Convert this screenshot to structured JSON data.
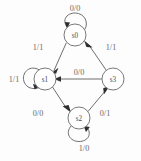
{
  "diagram": {
    "type": "state-transition-diagram",
    "notation": "input/output",
    "background_color": "#fdfdfd",
    "stroke_color": "#5d5d5d",
    "label_color": "#6b6b6b",
    "states": [
      {
        "id": "s0",
        "label": "s0",
        "cx": 75,
        "cy": 35,
        "r": 11
      },
      {
        "id": "s1",
        "label": "s1",
        "cx": 45,
        "cy": 79,
        "r": 11
      },
      {
        "id": "s2",
        "label": "s2",
        "cx": 79,
        "cy": 118,
        "r": 11
      },
      {
        "id": "s3",
        "label": "s3",
        "cx": 113,
        "cy": 79,
        "r": 11
      }
    ],
    "transitions": [
      {
        "from": "s0",
        "to": "s0",
        "label": "0/0",
        "kind": "self-loop",
        "side": "top",
        "label_x": 75,
        "label_y": 8
      },
      {
        "from": "s1",
        "to": "s1",
        "label": "1/1",
        "kind": "self-loop",
        "side": "left",
        "label_x": 14,
        "label_y": 79
      },
      {
        "from": "s2",
        "to": "s2",
        "label": "1/0",
        "kind": "self-loop",
        "side": "bottom",
        "label_x": 84,
        "label_y": 148
      },
      {
        "from": "s0",
        "to": "s1",
        "label": "1/1",
        "kind": "edge",
        "label_x": 38,
        "label_y": 47
      },
      {
        "from": "s3",
        "to": "s0",
        "label": "1/1",
        "kind": "edge",
        "label_x": 111,
        "label_y": 47
      },
      {
        "from": "s3",
        "to": "s1",
        "label": "0/0",
        "kind": "edge",
        "label_x": 79,
        "label_y": 72
      },
      {
        "from": "s1",
        "to": "s2",
        "label": "0/0",
        "kind": "edge",
        "label_x": 38,
        "label_y": 113
      },
      {
        "from": "s2",
        "to": "s3",
        "label": "0/1",
        "kind": "edge",
        "label_x": 105,
        "label_y": 113
      }
    ]
  }
}
